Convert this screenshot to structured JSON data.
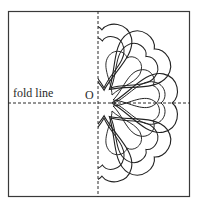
{
  "figure": {
    "labels": {
      "fold_line": "fold line",
      "origin": "O"
    },
    "frame": {
      "x": 8,
      "y": 11,
      "width": 182,
      "height": 186
    },
    "axes": {
      "vertical_x": 98,
      "horizontal_y": 103
    },
    "colors": {
      "stroke": "#2a2a2a",
      "background": "#ffffff"
    },
    "shapes": "hearts with offset outlines fanned around origin on right half, mirrored about fold line"
  }
}
